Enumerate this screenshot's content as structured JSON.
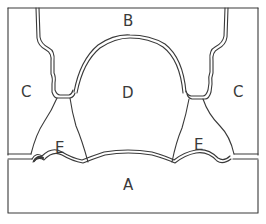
{
  "diagram": {
    "type": "anatomical-schematic",
    "stroke_color": "#3a3a3a",
    "background": "#ffffff",
    "labels": {
      "A": "A",
      "B": "B",
      "C_left": "C",
      "C_right": "C",
      "D": "D",
      "E_left": "E",
      "E_right": "E"
    },
    "regions": [
      {
        "id": "A",
        "description": "bottom rectangular block"
      },
      {
        "id": "B",
        "description": "top region above dome"
      },
      {
        "id": "C",
        "description": "left and right side columns"
      },
      {
        "id": "D",
        "description": "central dome-shaped region"
      },
      {
        "id": "E",
        "description": "lower flanking regions beside dome"
      }
    ]
  }
}
